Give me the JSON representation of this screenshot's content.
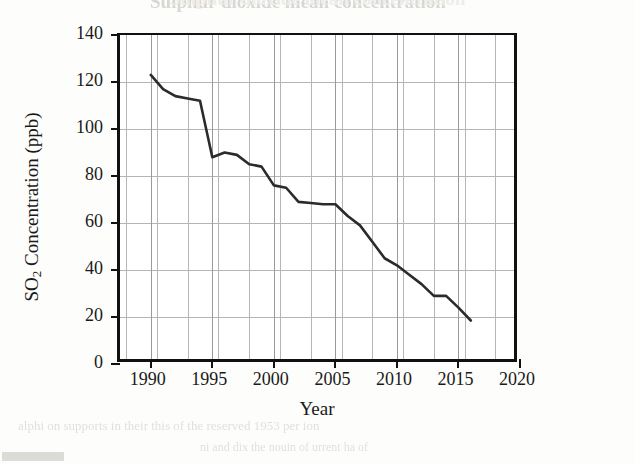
{
  "chart_data": {
    "type": "line",
    "title": "Sulphur dioxide mean concentration",
    "xlabel": "Year",
    "ylabel": "SO2 Concentration (ppb)",
    "ylabel_prefix": "SO",
    "ylabel_subscript": "2",
    "ylabel_suffix": " Concentration (ppb)",
    "xlim": [
      1987.5,
      2020
    ],
    "ylim": [
      0,
      140
    ],
    "grid": true,
    "legend": "none",
    "line_color": "#2b2b2b",
    "x_ticks": [
      1990,
      1995,
      2000,
      2005,
      2010,
      2015,
      2020
    ],
    "x_tick_labels": [
      "1990",
      "1995",
      "2000",
      "2005",
      "2010",
      "2015",
      "2020"
    ],
    "x_minor_tick_step": 1,
    "y_ticks": [
      0,
      20,
      40,
      60,
      80,
      100,
      120,
      140
    ],
    "y_tick_labels": [
      "0",
      "20",
      "40",
      "60",
      "80",
      "100",
      "120",
      "140"
    ],
    "series": [
      {
        "name": "SO2 mean concentration",
        "x": [
          1990,
          1991,
          1992,
          1993,
          1994,
          1995,
          1996,
          1997,
          1998,
          1999,
          2000,
          2001,
          2002,
          2003,
          2004,
          2005,
          2006,
          2007,
          2008,
          2009,
          2010,
          2011,
          2012,
          2013,
          2014,
          2015,
          2016
        ],
        "values": [
          123,
          117,
          114,
          113,
          112,
          88,
          90,
          89,
          85,
          84,
          76,
          75,
          69,
          68.5,
          68,
          68,
          63,
          59,
          52,
          45,
          42,
          38,
          34,
          29,
          29,
          24,
          18.5
        ]
      }
    ]
  },
  "artifacts": {
    "top_ghost": "Sulphur dioxide mean concentration",
    "bottom_ghost_1": "alphi on supports in their this of the reserved 1953 per   ion",
    "bottom_ghost_2": "ni  and  dix  the   nouin of  urrent   ha  of"
  }
}
